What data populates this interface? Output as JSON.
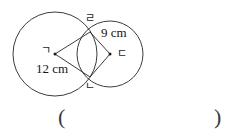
{
  "figure": {
    "type": "two-intersecting-circles-with-quadrilateral",
    "circles": [
      {
        "name": "left-circle",
        "cx": 55,
        "cy": 54,
        "r": 42,
        "center_label": "ㄱ",
        "radius_label": "12 cm"
      },
      {
        "name": "right-circle",
        "cx": 110,
        "cy": 54,
        "r": 33,
        "center_label": "ㄷ",
        "radius_label": "9 cm"
      }
    ],
    "intersection_points": [
      {
        "name": "top-intersection",
        "x": 90,
        "y": 32,
        "label": "ㄹ"
      },
      {
        "name": "bottom-intersection",
        "x": 90,
        "y": 77,
        "label": "ㄴ"
      }
    ],
    "quadrilateral_vertices": [
      "ㄱ",
      "ㄹ",
      "ㄷ",
      "ㄴ"
    ],
    "labels": {
      "center_left": "ㄱ",
      "center_right": "ㄷ",
      "intersection_top": "ㄹ",
      "intersection_bottom": "ㄴ",
      "measure_left": "12 cm",
      "measure_right": "9 cm"
    },
    "stroke_color": "#262626"
  },
  "answer": {
    "open_paren": "(",
    "close_paren": ")",
    "value": ""
  }
}
